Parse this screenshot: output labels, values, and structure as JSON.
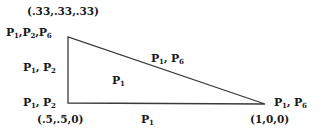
{
  "diagram": {
    "type": "triangle",
    "vertices": {
      "top_left": {
        "coordinate": "(.33,.33,.33)",
        "label": [
          {
            "p": "P",
            "s": "1"
          },
          {
            "p": "P",
            "s": "2"
          },
          {
            "p": "P",
            "s": "6"
          }
        ]
      },
      "bottom_left": {
        "coordinate": "(.5,.5,0)",
        "label": [
          {
            "p": "P",
            "s": "1"
          },
          {
            "p": "P",
            "s": "2"
          }
        ]
      },
      "bottom_right": {
        "coordinate": "(1,0,0)",
        "label": [
          {
            "p": "P",
            "s": "1"
          },
          {
            "p": "P",
            "s": "6"
          }
        ]
      }
    },
    "edges": {
      "left": [
        {
          "p": "P",
          "s": "1"
        },
        {
          "p": "P",
          "s": "2"
        }
      ],
      "hypotenuse": [
        {
          "p": "P",
          "s": "1"
        },
        {
          "p": "P",
          "s": "6"
        }
      ],
      "bottom": [
        {
          "p": "P",
          "s": "1"
        }
      ]
    },
    "interior": [
      {
        "p": "P",
        "s": "1"
      }
    ],
    "line_color": "#3a3a3a"
  }
}
